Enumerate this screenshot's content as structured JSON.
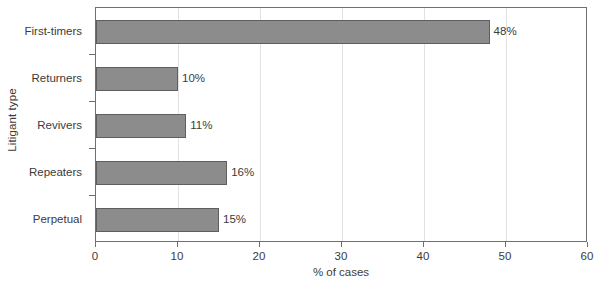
{
  "chart_data": {
    "type": "bar",
    "orientation": "horizontal",
    "title": "",
    "xlabel": "% of cases",
    "ylabel": "Litigant type",
    "categories": [
      "First-timers",
      "Returners",
      "Revivers",
      "Repeaters",
      "Perpetual"
    ],
    "values": [
      48,
      10,
      11,
      16,
      15
    ],
    "data_labels": [
      "48%",
      "10%",
      "11%",
      "16%",
      "15%"
    ],
    "xlim": [
      0,
      60
    ],
    "xticks": [
      0,
      10,
      20,
      30,
      40,
      50,
      60
    ],
    "xtick_labels": [
      "0",
      "10",
      "20",
      "30",
      "40",
      "50",
      "60"
    ],
    "grid": "vertical-only",
    "legend": "none",
    "bar_color": "#8c8c8c",
    "bar_edge_color": "#5e5e5e",
    "gridline_color": "#e2e2e2",
    "axis_color": "#6f6f6f",
    "text_color": "#3b3b3b",
    "background": "#ffffff"
  }
}
